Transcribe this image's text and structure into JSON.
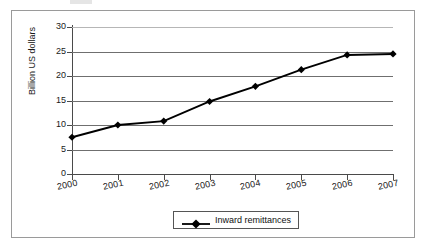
{
  "chart_data": {
    "type": "line",
    "title": "",
    "xlabel": "",
    "ylabel": "Billion US dollars",
    "categories": [
      "2000",
      "2001",
      "2002",
      "2003",
      "2004",
      "2005",
      "2006",
      "2007"
    ],
    "series": [
      {
        "name": "Inward remittances",
        "marker": "diamond",
        "color": "#000000",
        "values": [
          7.5,
          10.0,
          10.8,
          14.8,
          17.9,
          21.3,
          24.3,
          24.5
        ]
      }
    ],
    "ylim": [
      0,
      30
    ],
    "yticks": [
      0,
      5,
      10,
      15,
      20,
      25,
      30
    ],
    "ytick_labels": [
      "0",
      "5",
      "10",
      "15",
      "20",
      "25",
      "30"
    ],
    "grid": true,
    "grid_axis": "y",
    "legend_position": "bottom"
  },
  "legend": {
    "entry_label": "Inward remittances",
    "marker_icon": "diamond-marker-icon"
  },
  "axes": {
    "y_title": "Billion US dollars"
  }
}
